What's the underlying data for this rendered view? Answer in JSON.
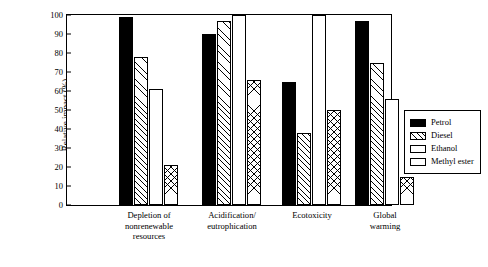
{
  "chart_data": {
    "type": "bar",
    "title": "",
    "xlabel": "",
    "ylabel": "Relative impact (%)",
    "ylim": [
      0,
      100
    ],
    "yticks": [
      0,
      10,
      20,
      30,
      40,
      50,
      60,
      70,
      80,
      90,
      100
    ],
    "grid": false,
    "legend_position": "right",
    "categories": [
      "Depletion of\nnonrenewable\nresources",
      "Acidification/\neutrophication",
      "Ecotoxicity",
      "Global\nwarming"
    ],
    "series": [
      {
        "name": "Petrol",
        "values": [
          99,
          90,
          65,
          97
        ],
        "fill": "solid-black"
      },
      {
        "name": "Diesel",
        "values": [
          78,
          97,
          38,
          75
        ],
        "fill": "diagonal-hatch"
      },
      {
        "name": "Ethanol",
        "values": [
          61,
          100,
          100,
          56
        ],
        "fill": "white"
      },
      {
        "name": "Methyl ester",
        "values": [
          21,
          66,
          50,
          15
        ],
        "fill": "cross-hatch"
      }
    ]
  },
  "legend": {
    "items": [
      {
        "label": "Petrol"
      },
      {
        "label": "Diesel"
      },
      {
        "label": "Ethanol"
      },
      {
        "label": "Methyl ester"
      }
    ]
  },
  "axis": {
    "y_label": "Relative impact (%)",
    "y_ticks": [
      "0",
      "10",
      "20",
      "30",
      "40",
      "50",
      "60",
      "70",
      "80",
      "90",
      "100"
    ]
  }
}
